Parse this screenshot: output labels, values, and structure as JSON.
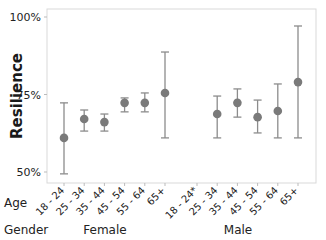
{
  "chart_data": {
    "type": "scatter",
    "subtype": "interval-plot",
    "title": "",
    "ylabel": "Resilience",
    "xlabel": "",
    "ylim": [
      0.47,
      1.0
    ],
    "yticks": [
      {
        "value": 1.0,
        "label": "100%"
      },
      {
        "value": 0.75,
        "label": "75%"
      },
      {
        "value": 0.5,
        "label": "50%"
      }
    ],
    "grid": false,
    "row_labels": {
      "age": "Age",
      "gender": "Gender"
    },
    "groups": [
      {
        "name": "Female",
        "categories": [
          "18 - 24",
          "25 - 34",
          "35 - 44",
          "45 - 54",
          "55 - 64",
          "65+"
        ],
        "mean": [
          0.61,
          0.671,
          0.661,
          0.723,
          0.723,
          0.755
        ],
        "lower": [
          0.494,
          0.632,
          0.632,
          0.694,
          0.694,
          0.61
        ],
        "upper": [
          0.723,
          0.7,
          0.687,
          0.739,
          0.755,
          0.887
        ]
      },
      {
        "name": "Male",
        "categories": [
          "18 - 24*",
          "25 - 34",
          "35 - 44",
          "45 - 54",
          "55 - 64",
          "65+"
        ],
        "mean": [
          null,
          0.687,
          0.723,
          0.677,
          0.697,
          0.79
        ],
        "lower": [
          null,
          0.61,
          0.677,
          0.626,
          0.61,
          0.61
        ],
        "upper": [
          null,
          0.745,
          0.768,
          0.732,
          0.784,
          0.971
        ]
      }
    ],
    "colors": {
      "marker": "#7a7a7a",
      "errorbar": "#8c8c8c",
      "frame": "#d9d9d9"
    }
  }
}
